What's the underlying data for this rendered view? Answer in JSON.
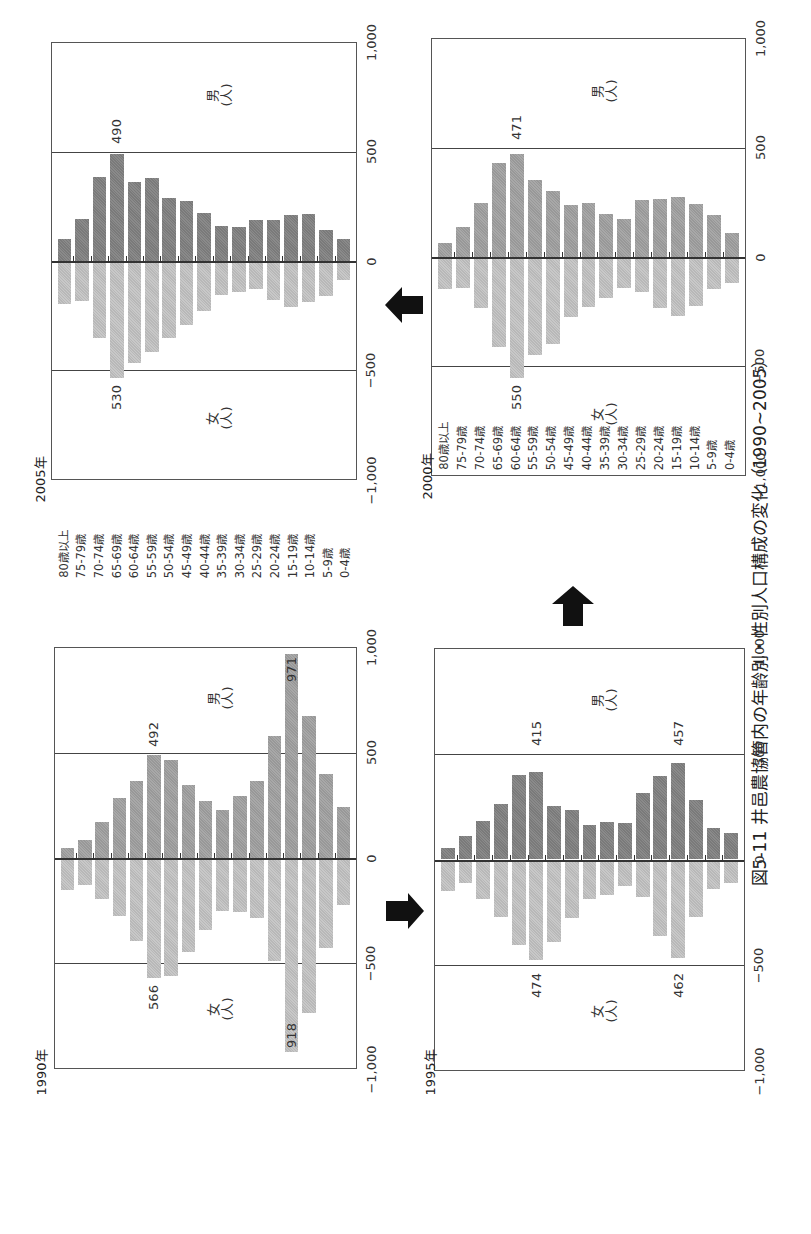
{
  "caption": "図5-11  井邑農協管内の年齢別・性別人口構成の変化（1990~2005）",
  "age_groups": [
    "80歳以上",
    "75-79歳",
    "70-74歳",
    "65-69歳",
    "60-64歳",
    "55-59歳",
    "50-54歳",
    "45-49歳",
    "40-44歳",
    "35-39歳",
    "30-34歳",
    "25-29歳",
    "20-24歳",
    "15-19歳",
    "10-14歳",
    "5-9歳",
    "0-4歳"
  ],
  "axis_ticks": [
    "1,000",
    "500",
    "0",
    "−500",
    "−1,000"
  ],
  "sex_labels": {
    "male": "男",
    "female": "女",
    "unit": "(人)"
  },
  "panels": {
    "p2005": {
      "year": "2005年",
      "peak_male": "490",
      "peak_female": "530"
    },
    "p1990": {
      "year": "1990年",
      "peak_male": "492",
      "peak_female": "566",
      "peak_male2": "971",
      "peak_female2": "918"
    },
    "p2000": {
      "year": "2000年",
      "peak_male": "471",
      "peak_female": "550"
    },
    "p1995": {
      "year": "1995年",
      "peak_male": "415",
      "peak_female": "474",
      "peak_male2": "457",
      "peak_female2": "462"
    }
  },
  "arrows": [
    {
      "from": "1990",
      "to": "1995",
      "direction": "right"
    },
    {
      "from": "1995",
      "to": "2000",
      "direction": "up"
    },
    {
      "from": "2000",
      "to": "2005",
      "direction": "left"
    }
  ],
  "chart_data": [
    {
      "type": "bar",
      "title": "1990年",
      "orientation": "population-pyramid",
      "categories": [
        "80歳以上",
        "75-79歳",
        "70-74歳",
        "65-69歳",
        "60-64歳",
        "55-59歳",
        "50-54歳",
        "45-49歳",
        "40-44歳",
        "35-39歳",
        "30-34歳",
        "25-29歳",
        "20-24歳",
        "15-19歳",
        "10-14歳",
        "5-9歳",
        "0-4歳"
      ],
      "series": [
        {
          "name": "男(人)",
          "values": [
            46,
            86,
            171,
            284,
            368,
            492,
            467,
            349,
            270,
            230,
            295,
            368,
            579,
            971,
            674,
            401,
            243
          ]
        },
        {
          "name": "女(人)",
          "values": [
            147,
            122,
            191,
            270,
            392,
            566,
            555,
            445,
            338,
            246,
            250,
            281,
            484,
            918,
            733,
            422,
            217
          ]
        }
      ],
      "annotations": [
        "492",
        "566",
        "971",
        "918"
      ],
      "xlabel": "",
      "ylabel": "人",
      "ylim": [
        -1000,
        1000
      ],
      "ticks": [
        -1000,
        -500,
        0,
        500,
        1000
      ],
      "grid": [
        500,
        -500
      ]
    },
    {
      "type": "bar",
      "title": "1995年",
      "orientation": "population-pyramid",
      "categories": [
        "80歳以上",
        "75-79歳",
        "70-74歳",
        "65-69歳",
        "60-64歳",
        "55-59歳",
        "50-54歳",
        "45-49歳",
        "40-44歳",
        "35-39歳",
        "30-34歳",
        "25-29歳",
        "20-24歳",
        "15-19歳",
        "10-14歳",
        "5-9歳",
        "0-4歳"
      ],
      "series": [
        {
          "name": "男(人)",
          "values": [
            53,
            110,
            185,
            262,
            401,
            415,
            252,
            234,
            165,
            178,
            172,
            317,
            397,
            457,
            282,
            149,
            124
          ]
        },
        {
          "name": "女(人)",
          "values": [
            145,
            106,
            183,
            267,
            400,
            474,
            388,
            271,
            183,
            164,
            119,
            173,
            358,
            462,
            267,
            136,
            109
          ]
        }
      ],
      "annotations": [
        "415",
        "474",
        "457",
        "462"
      ],
      "xlabel": "",
      "ylabel": "人",
      "ylim": [
        -1000,
        1000
      ],
      "ticks": [
        -1000,
        -500,
        0,
        500,
        1000
      ],
      "grid": [
        500,
        -500
      ]
    },
    {
      "type": "bar",
      "title": "2000年",
      "orientation": "population-pyramid",
      "categories": [
        "80歳以上",
        "75-79歳",
        "70-74歳",
        "65-69歳",
        "60-64歳",
        "55-59歳",
        "50-54歳",
        "45-49歳",
        "40-44歳",
        "35-39歳",
        "30-34歳",
        "25-29歳",
        "20-24歳",
        "15-19歳",
        "10-14歳",
        "5-9歳",
        "0-4歳"
      ],
      "series": [
        {
          "name": "男(人)",
          "values": [
            65,
            139,
            249,
            431,
            471,
            353,
            303,
            240,
            246,
            198,
            174,
            263,
            268,
            273,
            242,
            191,
            109
          ]
        },
        {
          "name": "女(人)",
          "values": [
            143,
            137,
            228,
            406,
            550,
            443,
            393,
            271,
            225,
            185,
            137,
            158,
            230,
            264,
            219,
            141,
            115
          ]
        }
      ],
      "annotations": [
        "471",
        "550"
      ],
      "xlabel": "",
      "ylabel": "人",
      "ylim": [
        -1000,
        1000
      ],
      "ticks": [
        -1000,
        -500,
        0,
        500,
        1000
      ],
      "grid": [
        500,
        -500
      ]
    },
    {
      "type": "bar",
      "title": "2005年",
      "orientation": "population-pyramid",
      "categories": [
        "80歳以上",
        "75-79歳",
        "70-74歳",
        "65-69歳",
        "60-64歳",
        "55-59歳",
        "50-54歳",
        "45-49歳",
        "40-44歳",
        "35-39歳",
        "30-34歳",
        "25-29歳",
        "20-24歳",
        "15-19歳",
        "10-14歳",
        "5-9歳",
        "0-4歳"
      ],
      "series": [
        {
          "name": "男(人)",
          "values": [
            100,
            192,
            387,
            490,
            364,
            383,
            289,
            277,
            220,
            162,
            158,
            187,
            188,
            210,
            214,
            143,
            101
          ]
        },
        {
          "name": "女(人)",
          "values": [
            192,
            177,
            349,
            530,
            463,
            413,
            348,
            290,
            225,
            153,
            136,
            123,
            173,
            208,
            182,
            156,
            83
          ]
        }
      ],
      "annotations": [
        "490",
        "530"
      ],
      "xlabel": "",
      "ylabel": "人",
      "ylim": [
        -1000,
        1000
      ],
      "ticks": [
        -1000,
        -500,
        0,
        500,
        1000
      ],
      "grid": [
        500,
        -500
      ]
    }
  ]
}
